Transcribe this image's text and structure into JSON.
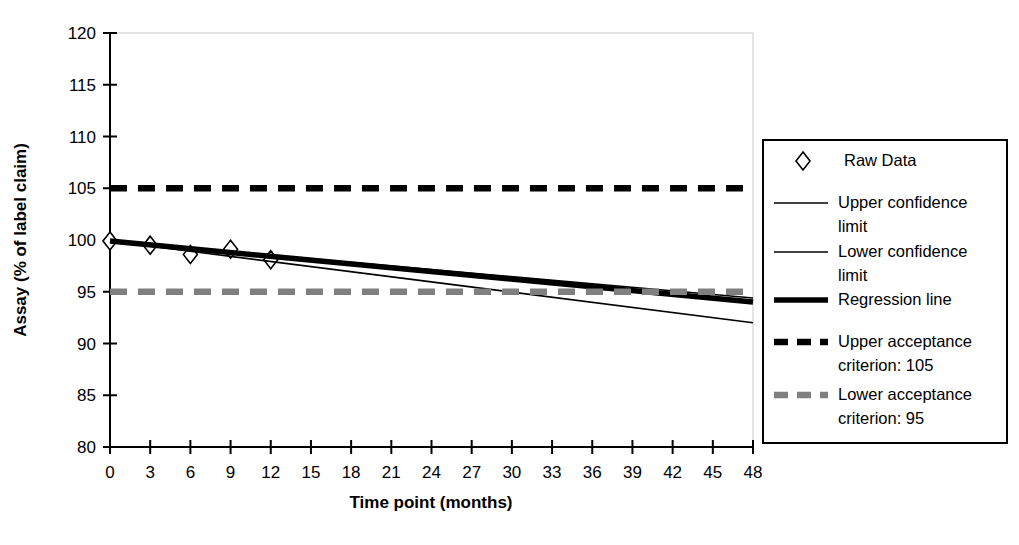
{
  "chart_data": {
    "type": "line",
    "title": "",
    "xlabel": "Time point (months)",
    "ylabel": "Assay (% of label claim)",
    "xlim": [
      0,
      48
    ],
    "ylim": [
      80,
      120
    ],
    "xticks": [
      0,
      3,
      6,
      9,
      12,
      15,
      18,
      21,
      24,
      27,
      30,
      33,
      36,
      39,
      42,
      45,
      48
    ],
    "yticks": [
      80,
      85,
      90,
      95,
      100,
      105,
      110,
      115,
      120
    ],
    "grid": false,
    "legend_position": "right-outside",
    "series": [
      {
        "name": "Raw Data",
        "style": "markers",
        "marker": "diamond-open",
        "color": "#000000",
        "x": [
          0,
          3,
          6,
          9,
          12
        ],
        "values": [
          99.9,
          99.5,
          98.6,
          99.1,
          98.1
        ]
      },
      {
        "name": "Upper confidence limit",
        "style": "thin-line",
        "color": "#000000",
        "x": [
          0,
          48
        ],
        "values": [
          99.9,
          94.4
        ]
      },
      {
        "name": "Lower confidence limit",
        "style": "thin-line",
        "color": "#000000",
        "x": [
          0,
          48
        ],
        "values": [
          99.9,
          92.0
        ]
      },
      {
        "name": "Regression line",
        "style": "thick-line",
        "color": "#000000",
        "x": [
          0,
          48
        ],
        "values": [
          99.9,
          94.0
        ]
      },
      {
        "name": "Upper acceptance criterion: 105",
        "style": "thick-dashed",
        "color": "#000000",
        "x": [
          0,
          48
        ],
        "values": [
          105,
          105
        ]
      },
      {
        "name": "Lower acceptance criterion: 95",
        "style": "thick-dashed",
        "color": "#808080",
        "x": [
          0,
          48
        ],
        "values": [
          95,
          95
        ]
      }
    ],
    "annotations": []
  },
  "legend": {
    "entries": [
      {
        "label": "Raw Data",
        "swatch": "diamond-open-marker",
        "color": "#000000"
      },
      {
        "label": "Upper confidence",
        "label2": "limit",
        "swatch": "thin-line",
        "color": "#000000"
      },
      {
        "label": "Lower confidence",
        "label2": "limit",
        "swatch": "thin-line",
        "color": "#000000"
      },
      {
        "label": "Regression line",
        "label2": "",
        "swatch": "thick-line",
        "color": "#000000"
      },
      {
        "label": "Upper acceptance",
        "label2": "criterion: 105",
        "swatch": "thick-dashed-black",
        "color": "#000000"
      },
      {
        "label": "Lower acceptance",
        "label2": "criterion: 95",
        "swatch": "thick-dashed-gray",
        "color": "#808080"
      }
    ]
  },
  "axes": {
    "x_title": "Time point (months)",
    "y_title": "Assay (% of label claim)",
    "x_tick_labels": [
      "0",
      "3",
      "6",
      "9",
      "12",
      "15",
      "18",
      "21",
      "24",
      "27",
      "30",
      "33",
      "36",
      "39",
      "42",
      "45",
      "48"
    ],
    "y_tick_labels": [
      "80",
      "85",
      "90",
      "95",
      "100",
      "105",
      "110",
      "115",
      "120"
    ]
  },
  "colors": {
    "axis": "#000000",
    "frame": "#c8c8c8",
    "gray_criterion": "#808080",
    "black_criterion": "#000000",
    "background": "#ffffff"
  }
}
